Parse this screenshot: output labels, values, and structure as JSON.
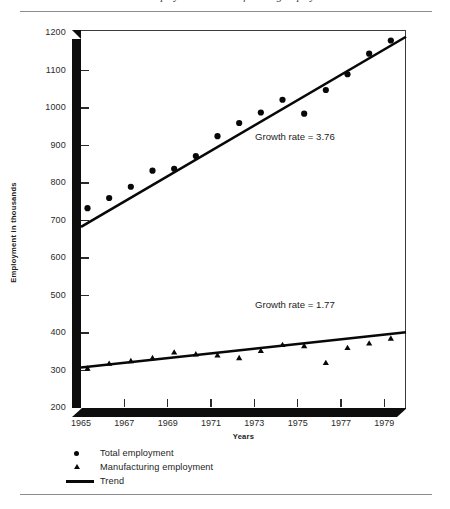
{
  "chart_data": {
    "type": "scatter",
    "title": "Total employment and manufacturing employment",
    "xlabel": "Years",
    "ylabel": "Employment in thousands",
    "xlim": [
      1965,
      1980
    ],
    "ylim": [
      200,
      1200
    ],
    "ytick_labels": [
      "1200",
      "1100",
      "1000",
      "900",
      "800",
      "700",
      "600",
      "500",
      "400",
      "300",
      "200"
    ],
    "ytick_values": [
      1200,
      1100,
      1000,
      900,
      800,
      700,
      600,
      500,
      400,
      300,
      200
    ],
    "xtick_labels": [
      "1965",
      "1967",
      "1969",
      "1971",
      "1973",
      "1975",
      "1977",
      "1979"
    ],
    "xtick_values": [
      1965,
      1967,
      1969,
      1971,
      1973,
      1975,
      1977,
      1979
    ],
    "grid": false,
    "legend_position": "below-axes",
    "series": [
      {
        "name": "Total employment",
        "marker": "circle",
        "color": "#080808",
        "x": [
          1965.3,
          1966.3,
          1967.3,
          1968.3,
          1969.3,
          1970.3,
          1971.3,
          1972.3,
          1973.3,
          1974.3,
          1975.3,
          1976.3,
          1977.3,
          1978.3,
          1979.3
        ],
        "values": [
          733,
          760,
          790,
          833,
          838,
          872,
          925,
          960,
          988,
          1022,
          985,
          1048,
          1090,
          1145,
          1180
        ]
      },
      {
        "name": "Manufacturing employment",
        "marker": "triangle",
        "color": "#080808",
        "x": [
          1965.3,
          1966.3,
          1967.3,
          1968.3,
          1969.3,
          1970.3,
          1971.3,
          1972.3,
          1973.3,
          1974.3,
          1975.3,
          1976.3,
          1977.3,
          1978.3,
          1979.3
        ],
        "values": [
          305,
          318,
          325,
          333,
          348,
          343,
          340,
          333,
          352,
          368,
          365,
          320,
          360,
          372,
          385
        ]
      }
    ],
    "trend_lines": [
      {
        "name": "Total employment trend",
        "x": [
          1965,
          1980
        ],
        "values": [
          683,
          1190
        ],
        "growth_rate": 3.76,
        "annotation": "Growth rate = 3.76"
      },
      {
        "name": "Manufacturing employment trend",
        "x": [
          1965,
          1980
        ],
        "values": [
          308,
          402
        ],
        "growth_rate": 1.77,
        "annotation": "Growth rate = 1.77"
      }
    ],
    "legend": [
      {
        "label": "Total employment",
        "marker": "circle"
      },
      {
        "label": "Manufacturing employment",
        "marker": "triangle"
      },
      {
        "label": "Trend",
        "marker": "line"
      }
    ]
  }
}
